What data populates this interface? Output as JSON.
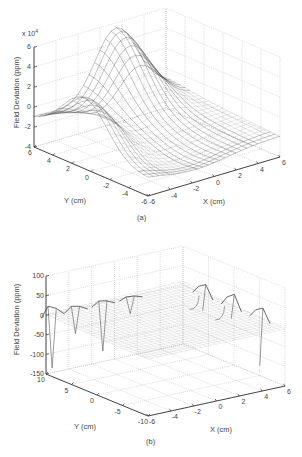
{
  "figure": {
    "panel_a_label": "(a)",
    "panel_b_label": "(b)"
  },
  "chart_data": [
    {
      "type": "surface",
      "panel": "(a)",
      "title": "",
      "xlabel": "X (cm)",
      "ylabel": "Y (cm)",
      "zlabel": "Field Deviation (ppm)",
      "z_multiplier": "x 10^4",
      "z_multiplier_text": "x 10",
      "z_multiplier_exp": "4",
      "xlim": [
        -6,
        6
      ],
      "ylim": [
        -6,
        6
      ],
      "zlim": [
        -4,
        6
      ],
      "x_ticks": [
        "-6",
        "-4",
        "-2",
        "0",
        "2",
        "4",
        "6"
      ],
      "y_ticks": [
        "6",
        "4",
        "2",
        "0",
        "-2",
        "-4",
        "-6"
      ],
      "z_ticks": [
        "6",
        "4",
        "2",
        "0",
        "-2",
        "-4"
      ],
      "grid": true,
      "description": "Saddle-shaped mesh surface: peaks near z=+3 (x10^4) along the Y edge and near z=+5 along the X edge, low near z=-2 at corners",
      "surface_samples": {
        "x": [
          -6,
          -3,
          0,
          3,
          6
        ],
        "y": [
          -6,
          -3,
          0,
          3,
          6
        ],
        "z_x1e4": [
          [
            -1.5,
            -0.5,
            0.0,
            1.2,
            2.0
          ],
          [
            -0.8,
            -0.3,
            0.2,
            2.5,
            4.5
          ],
          [
            -0.5,
            0.0,
            0.3,
            3.0,
            5.0
          ],
          [
            0.5,
            0.8,
            0.4,
            2.5,
            4.5
          ],
          [
            -2.0,
            3.0,
            0.0,
            1.2,
            2.0
          ]
        ]
      }
    },
    {
      "type": "surface",
      "panel": "(b)",
      "title": "",
      "xlabel": "X (cm)",
      "ylabel": "Y (cm)",
      "zlabel": "Field Deviation (ppm)",
      "xlim": [
        -6,
        6
      ],
      "ylim": [
        -10,
        10
      ],
      "zlim": [
        -150,
        100
      ],
      "x_ticks": [
        "-6",
        "-4",
        "-2",
        "0",
        "2",
        "4",
        "6"
      ],
      "y_ticks": [
        "10",
        "5",
        "0",
        "-5",
        "-10"
      ],
      "z_ticks": [
        "100",
        "50",
        "0",
        "-50",
        "-100",
        "-150"
      ],
      "grid": true,
      "description": "Nearly flat mesh surface near 0 ppm with sharp spikes at the edges reaching about +30 ppm and dipping to about -140 ppm",
      "spikes": [
        {
          "edge": "y=+10",
          "x": -6,
          "z_max": 25,
          "z_min": -135
        },
        {
          "edge": "y=+10",
          "x": -2,
          "z_max": 10,
          "z_min": -80
        },
        {
          "edge": "y=+10",
          "x": 2,
          "z_max": 10,
          "z_min": -120
        },
        {
          "edge": "x=+6",
          "y": 5,
          "z_max": 30,
          "z_min": -40
        },
        {
          "edge": "x=+6",
          "y": 0,
          "z_max": 35,
          "z_min": -30
        },
        {
          "edge": "x=+6",
          "y": -5,
          "z_max": 30,
          "z_min": -120
        }
      ]
    }
  ]
}
